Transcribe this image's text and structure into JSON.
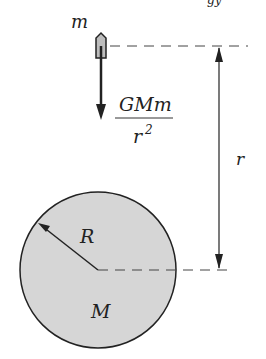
{
  "diagram": {
    "title_fragment": "gy",
    "labels": {
      "small_mass": "m",
      "force_numerator": "GMm",
      "force_denominator_base": "r",
      "force_denominator_exp": "2",
      "distance": "r",
      "radius": "R",
      "large_mass": "M"
    },
    "colors": {
      "sphere_fill": "#d6d6d6",
      "stroke": "#222222"
    }
  }
}
